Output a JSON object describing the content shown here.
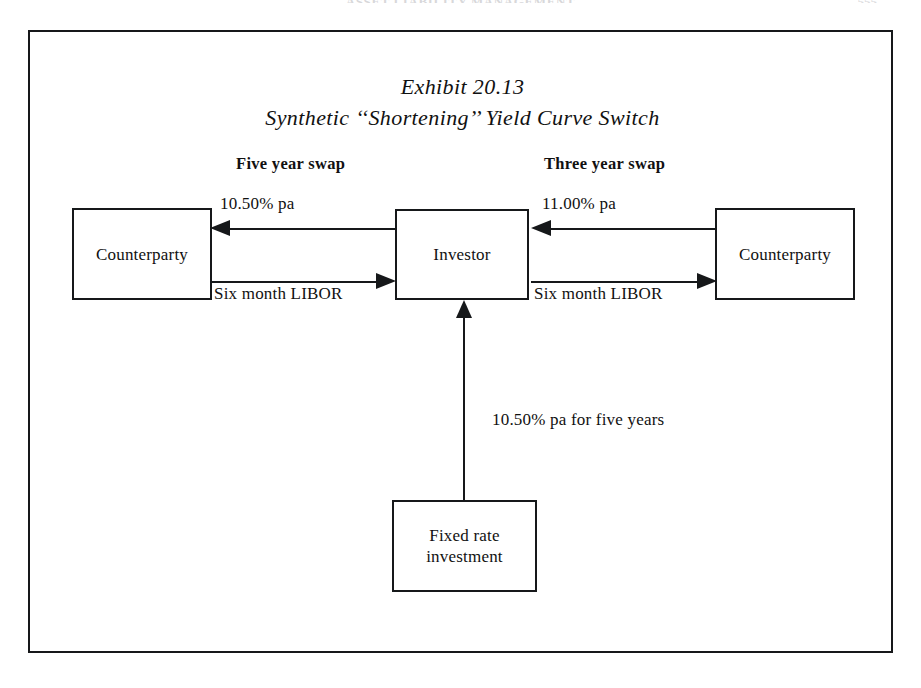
{
  "page": {
    "running_header": "ASSET LIABILITY MANAGEMENT",
    "folio": "555"
  },
  "exhibit": {
    "number_line": "Exhibit 20.13",
    "title_line": "Synthetic ‘‘Shortening’’ Yield Curve Switch"
  },
  "sections": {
    "left_swap_heading": "Five year swap",
    "right_swap_heading": "Three year swap"
  },
  "nodes": {
    "left_counterparty": "Counterparty",
    "investor": "Investor",
    "right_counterparty": "Counterparty",
    "fixed_rate_investment_line1": "Fixed rate",
    "fixed_rate_investment_line2": "investment"
  },
  "flows": {
    "left_fixed_rate": "10.50% pa",
    "right_fixed_rate": "11.00% pa",
    "left_floating_rate": "Six month LIBOR",
    "right_floating_rate": "Six month LIBOR",
    "investment_rate": "10.50% pa for five years"
  },
  "colors": {
    "ink": "#16181a",
    "paper": "#ffffff"
  }
}
